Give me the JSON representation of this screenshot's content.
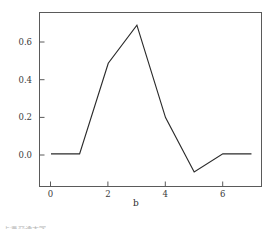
{
  "figure": {
    "background_color": "#ffffff",
    "frame_color": "#5a5a5a",
    "line_color": "#2b2b2b",
    "tick_label_color": "#3a3a3a",
    "bottom_caption": "上海交通大学"
  },
  "chart_data": {
    "type": "line",
    "title": "",
    "subtitle": "",
    "xlabel": "b",
    "ylabel": "",
    "x": [
      0,
      1,
      2,
      3,
      4,
      5,
      6,
      7
    ],
    "values": [
      0.0,
      0.0,
      0.5,
      0.71,
      0.2,
      -0.1,
      0.0,
      0.0
    ],
    "series": [
      {
        "name": "",
        "values": [
          0.0,
          0.0,
          0.5,
          0.71,
          0.2,
          -0.1,
          0.0,
          0.0
        ]
      }
    ],
    "xlim": [
      -0.4,
      7.35
    ],
    "ylim": [
      -0.18,
      0.78
    ],
    "xticks": [
      0,
      2,
      4,
      6
    ],
    "xtick_labels": [
      "0",
      "2",
      "4",
      "6"
    ],
    "yticks": [
      0.0,
      0.2,
      0.4,
      0.6
    ],
    "ytick_labels": [
      "0.0",
      "0.2",
      "0.4",
      "0.6"
    ],
    "grid": false,
    "legend": false,
    "legend_position": "none",
    "markers": false,
    "annotations": []
  }
}
